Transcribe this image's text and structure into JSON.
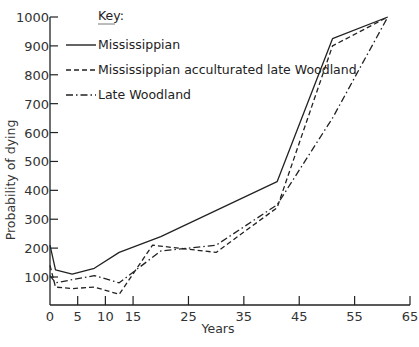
{
  "chart_data": {
    "type": "line",
    "title": "",
    "xlabel": "Years",
    "ylabel": "Probability of dying",
    "xlim": [
      0,
      65
    ],
    "ylim": [
      0,
      1000
    ],
    "grid": false,
    "legend_position": "top-left",
    "legend_title": "Key:",
    "x_ticks": [
      0,
      5,
      10,
      15,
      25,
      35,
      45,
      55,
      65
    ],
    "y_ticks": [
      100,
      200,
      300,
      400,
      500,
      600,
      700,
      800,
      900,
      1000
    ],
    "series": [
      {
        "name": "Mississippian",
        "style": "solid",
        "x": [
          0,
          1,
          4,
          8,
          12.5,
          20,
          41,
          51,
          61
        ],
        "values": [
          210,
          125,
          110,
          130,
          185,
          240,
          430,
          925,
          1000
        ]
      },
      {
        "name": "Mississippian acculturated late Woodland",
        "style": "dashed",
        "x": [
          0,
          1,
          4,
          8,
          12.5,
          18.5,
          30,
          41,
          51,
          61
        ],
        "values": [
          140,
          65,
          60,
          65,
          40,
          210,
          185,
          340,
          900,
          1000
        ]
      },
      {
        "name": "Late Woodland",
        "style": "dashdot",
        "x": [
          0,
          1,
          8,
          12.5,
          20,
          30,
          41,
          51,
          61
        ],
        "values": [
          105,
          80,
          105,
          80,
          190,
          210,
          350,
          650,
          1000
        ]
      }
    ]
  },
  "legend": {
    "title": "Key:",
    "items": [
      {
        "label": "Mississippian"
      },
      {
        "label": "Mississippian acculturated late Woodland"
      },
      {
        "label": "Late Woodland"
      }
    ]
  },
  "axes": {
    "x_title": "Years",
    "y_title": "Probability of dying"
  }
}
